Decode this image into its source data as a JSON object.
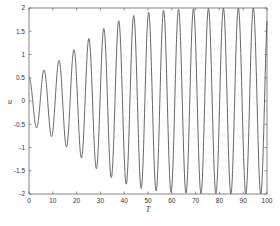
{
  "chart_data": {
    "type": "line",
    "title": "",
    "xlabel": "T",
    "ylabel": "u",
    "xlim": [
      0,
      100
    ],
    "ylim": [
      -2,
      2
    ],
    "xticks": [
      0,
      10,
      20,
      30,
      40,
      50,
      60,
      70,
      80,
      90,
      100
    ],
    "yticks": [
      2,
      1.5,
      1,
      0.5,
      0,
      -0.5,
      -1,
      -1.5,
      -2
    ],
    "ytick_labels": [
      "2",
      "1.5",
      "1",
      "0.5",
      "0",
      "-0.5",
      "-1",
      "-1.5",
      "-2"
    ],
    "xtick_labels": [
      "0",
      "10",
      "20",
      "30",
      "40",
      "50",
      "60",
      "70",
      "80",
      "90",
      "100"
    ],
    "grid": false,
    "legend": null,
    "series": [
      {
        "name": "u(T)",
        "description": "Growing oscillation approaching limit cycle of amplitude 2",
        "model": {
          "form": "A(T)*cos(T)",
          "A0": 0.5,
          "A_limit": 2,
          "epsilon": 0.1,
          "omega": 1
        },
        "color": "#555555",
        "peaks": [
          {
            "x": 6.3,
            "y": 0.66
          },
          {
            "x": 12.6,
            "y": 0.88
          },
          {
            "x": 18.8,
            "y": 1.12
          },
          {
            "x": 25.1,
            "y": 1.35
          },
          {
            "x": 31.4,
            "y": 1.57
          },
          {
            "x": 37.7,
            "y": 1.73
          },
          {
            "x": 44.0,
            "y": 1.84
          },
          {
            "x": 50.3,
            "y": 1.92
          },
          {
            "x": 56.5,
            "y": 1.96
          },
          {
            "x": 62.8,
            "y": 1.98
          },
          {
            "x": 69.1,
            "y": 1.99
          },
          {
            "x": 75.4,
            "y": 2.0
          },
          {
            "x": 81.7,
            "y": 2.0
          },
          {
            "x": 88.0,
            "y": 2.0
          },
          {
            "x": 94.2,
            "y": 2.0
          }
        ],
        "troughs": [
          {
            "x": 3.1,
            "y": -0.56
          },
          {
            "x": 9.4,
            "y": -0.75
          },
          {
            "x": 15.7,
            "y": -0.97
          },
          {
            "x": 22.0,
            "y": -1.2
          },
          {
            "x": 28.3,
            "y": -1.42
          },
          {
            "x": 34.6,
            "y": -1.63
          },
          {
            "x": 40.8,
            "y": -1.81
          },
          {
            "x": 47.1,
            "y": -1.9
          },
          {
            "x": 53.4,
            "y": -1.95
          },
          {
            "x": 59.7,
            "y": -1.97
          },
          {
            "x": 66.0,
            "y": -1.99
          },
          {
            "x": 72.3,
            "y": -2.0
          },
          {
            "x": 78.5,
            "y": -2.0
          },
          {
            "x": 84.8,
            "y": -2.0
          },
          {
            "x": 91.1,
            "y": -2.0
          },
          {
            "x": 97.4,
            "y": -2.0
          }
        ],
        "start": {
          "x": 0,
          "y": 0.5
        }
      }
    ]
  },
  "plot_frame": {
    "left": 29,
    "right": 267,
    "top": 8,
    "bottom": 194
  }
}
